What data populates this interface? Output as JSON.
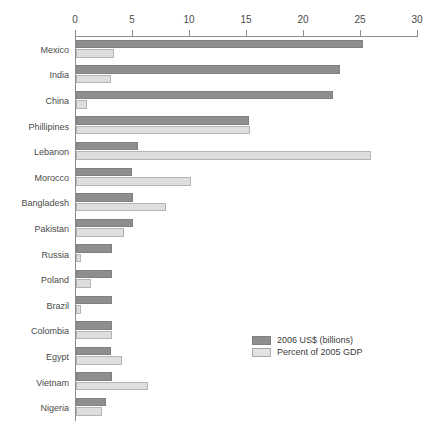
{
  "chart_data": {
    "type": "bar",
    "orientation": "horizontal",
    "title": "",
    "xlabel": "",
    "ylabel": "",
    "xlim": [
      0,
      30
    ],
    "xticks": [
      0,
      5,
      10,
      15,
      20,
      25,
      30
    ],
    "grid": false,
    "legend_position": "center-right",
    "categories": [
      "Mexico",
      "India",
      "China",
      "Phillipines",
      "Lebanon",
      "Morocco",
      "Bangladesh",
      "Pakistan",
      "Russia",
      "Poland",
      "Brazil",
      "Colombia",
      "Egypt",
      "Vietnam",
      "Nigeria"
    ],
    "series": [
      {
        "name": "2006 US$ (billions)",
        "color": "#8e8e8e",
        "values": [
          25.2,
          23.2,
          22.5,
          15.2,
          5.4,
          4.9,
          5.0,
          5.0,
          3.2,
          3.2,
          3.2,
          3.2,
          3.1,
          3.2,
          2.6
        ]
      },
      {
        "name": "Percent of 2005 GDP",
        "color": "#dedede",
        "values": [
          3.3,
          3.1,
          1.0,
          15.3,
          25.9,
          10.1,
          7.9,
          4.2,
          0.4,
          1.3,
          0.4,
          3.2,
          4.0,
          6.3,
          2.3
        ]
      }
    ]
  },
  "legend": {
    "items": [
      {
        "label": "2006 US$ (billions)"
      },
      {
        "label": "Percent of 2005 GDP"
      }
    ]
  },
  "colors": {
    "series_dark": "#8e8e8e",
    "series_light": "#dedede",
    "axis": "#8c8c8c",
    "text": "#4a4a4a",
    "background": "#ffffff"
  }
}
